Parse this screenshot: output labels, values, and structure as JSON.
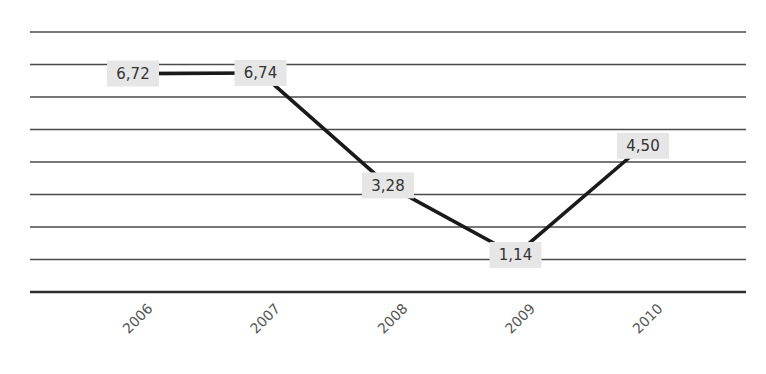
{
  "chart_data": {
    "type": "line",
    "title": "",
    "xlabel": "",
    "ylabel": "",
    "categories": [
      "2006",
      "2007",
      "2008",
      "2009",
      "2010"
    ],
    "series": [
      {
        "name": "Series 1",
        "values": [
          6.72,
          6.74,
          3.28,
          1.14,
          4.5
        ],
        "labels": [
          "6,72",
          "6,74",
          "3,28",
          "1,14",
          "4,50"
        ]
      }
    ],
    "ylim": [
      0,
      8
    ],
    "yticks_shown": false,
    "grid": true,
    "gridline_count": 8,
    "legend": "none",
    "decimal_separator": ","
  },
  "colors": {
    "line": "#1a1a1a",
    "gridline": "#4a4a4a",
    "label_background": "#e6e6e6",
    "label_text": "#333333",
    "tick_text": "#555555"
  }
}
